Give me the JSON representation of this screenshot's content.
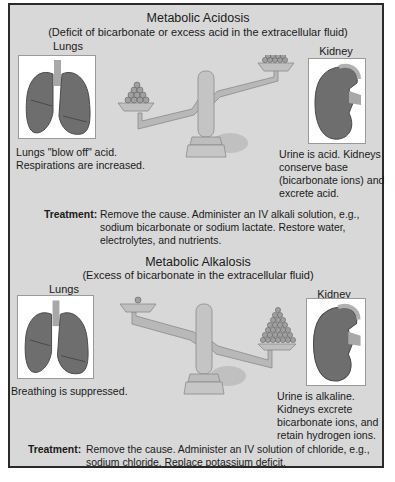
{
  "acidosis": {
    "title": "Metabolic Acidosis",
    "subtitle": "(Deficit of bicarbonate or excess acid in the extracellular fluid)",
    "lungs_label": "Lungs",
    "kidney_label": "Kidney",
    "lungs_text": [
      "Lungs \"blow off\" acid.",
      "Respirations are increased."
    ],
    "kidney_text": [
      "Urine is acid. Kidneys",
      "conserve base",
      "(bicarbonate ions) and",
      "excrete acid."
    ],
    "scale": {
      "left_pile_size": "small",
      "right_pile_size": "medium",
      "tilt": "right-high"
    },
    "treatment_label": "Treatment:",
    "treatment_lines": [
      "Remove the cause. Administer an IV alkali solution, e.g.,",
      "sodium bicarbonate or sodium lactate. Restore water,",
      "electrolytes, and nutrients."
    ]
  },
  "alkalosis": {
    "title": "Metabolic Alkalosis",
    "subtitle": "(Excess of bicarbonate in the extracellular fluid)",
    "lungs_label": "Lungs",
    "kidney_label": "Kidney",
    "lungs_text": [
      "Breathing is suppressed."
    ],
    "kidney_text": [
      "Urine is alkaline.",
      "Kidneys excrete",
      "bicarbonate ions, and",
      "retain hydrogen ions."
    ],
    "scale": {
      "left_pile_size": "single",
      "right_pile_size": "large",
      "tilt": "left-high"
    },
    "treatment_label": "Treatment:",
    "treatment_lines": [
      "Remove the cause. Administer an IV solution of chloride, e.g.,",
      "sodium chloride. Replace potassium deficit."
    ]
  },
  "colors": {
    "panel_bg": "#d8d8d8",
    "border": "#2a2a2a",
    "organ": "#6e6e6e",
    "scale_metal": "#b8b8b8"
  }
}
